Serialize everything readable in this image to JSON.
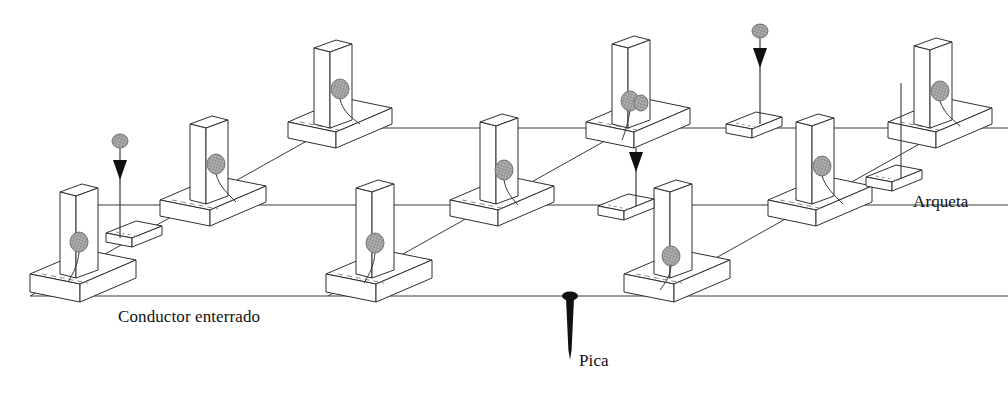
{
  "diagram": {
    "projection": "isometric",
    "background_color": "#ffffff",
    "line_color": "#2b2b2b",
    "face_color": "#ffffff",
    "connector_color": "#9a9a9a",
    "connector_stroke": "#555555",
    "pica_color": "#111111",
    "labels": [
      {
        "id": "conductor",
        "text": "Conductor enterrado",
        "x": 118,
        "y": 322
      },
      {
        "id": "pica",
        "text": "Pica",
        "x": 579,
        "y": 366
      },
      {
        "id": "arqueta",
        "text": "Arqueta",
        "x": 913,
        "y": 207
      }
    ],
    "legend_terms": {
      "conductor_enterrado": "Conductor enterrado",
      "pica": "Pica",
      "arqueta": "Arqueta"
    },
    "grid": {
      "rows": 3,
      "cols": 3,
      "column_count": 9,
      "footing_count": 9,
      "arqueta_count": 4,
      "pica_marker_count": 4
    },
    "elements": {
      "column_label": "Pilar",
      "footing_label": "Zapata",
      "conductor_label": "Conductor enterrado",
      "arqueta_label": "Arqueta",
      "pica_label": "Pica",
      "connector_label": "Conexión de puesta a tierra"
    },
    "columns": [
      {
        "id": "c-r0-k0",
        "row": 0,
        "col": 0,
        "base_x": 330,
        "base_y": 128,
        "connector": true
      },
      {
        "id": "c-r0-k1",
        "row": 0,
        "col": 1,
        "base_x": 628,
        "base_y": 128,
        "connector": true
      },
      {
        "id": "c-r0-k2",
        "row": 0,
        "col": 2,
        "base_x": 930,
        "base_y": 128,
        "connector": true
      },
      {
        "id": "c-r1-k0",
        "row": 1,
        "col": 0,
        "base_x": 212,
        "base_y": 205,
        "connector": true
      },
      {
        "id": "c-r1-k1",
        "row": 1,
        "col": 1,
        "base_x": 500,
        "base_y": 205,
        "connector": true
      },
      {
        "id": "c-r1-k2",
        "row": 1,
        "col": 2,
        "base_x": 815,
        "base_y": 205,
        "connector": true
      },
      {
        "id": "c-r2-k0",
        "row": 2,
        "col": 0,
        "base_x": 82,
        "base_y": 280,
        "connector": true
      },
      {
        "id": "c-r2-k1",
        "row": 2,
        "col": 1,
        "base_x": 375,
        "base_y": 280,
        "connector": true
      },
      {
        "id": "c-r2-k2",
        "row": 2,
        "col": 2,
        "base_x": 672,
        "base_y": 280,
        "connector": true
      }
    ],
    "arquetas": [
      {
        "id": "a-0",
        "x": 130,
        "y": 235
      },
      {
        "id": "a-1",
        "x": 622,
        "y": 208
      },
      {
        "id": "a-2",
        "x": 748,
        "y": 125
      },
      {
        "id": "a-3",
        "x": 888,
        "y": 178
      }
    ],
    "picas": [
      {
        "id": "p-0",
        "x": 120,
        "y": 139,
        "tip_y": 240,
        "style": "arrow"
      },
      {
        "id": "p-1",
        "x": 636,
        "y": 152,
        "tip_y": 208,
        "style": "arrow"
      },
      {
        "id": "p-2",
        "x": 760,
        "y": 30,
        "tip_y": 125,
        "style": "arrow"
      },
      {
        "id": "p-3",
        "x": 901,
        "y": 83,
        "tip_y": 178,
        "style": "plain"
      },
      {
        "id": "p-main",
        "x": 570,
        "y": 295,
        "tip_y": 358,
        "style": "nail"
      }
    ]
  }
}
